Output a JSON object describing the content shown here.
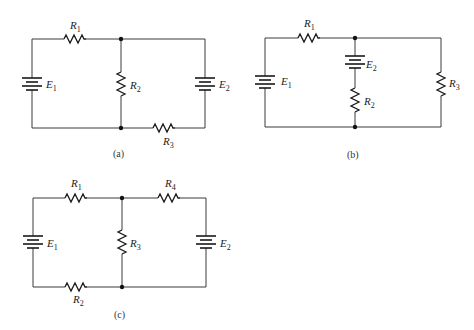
{
  "figure": {
    "circuits": [
      {
        "id": "a",
        "caption": "(a)",
        "components": {
          "R1": {
            "letter": "R",
            "sub": "1"
          },
          "R2": {
            "letter": "R",
            "sub": "2"
          },
          "R3": {
            "letter": "R",
            "sub": "3"
          },
          "E1": {
            "letter": "E",
            "sub": "1"
          },
          "E2": {
            "letter": "E",
            "sub": "2"
          }
        }
      },
      {
        "id": "b",
        "caption": "(b)",
        "components": {
          "R1": {
            "letter": "R",
            "sub": "1"
          },
          "R2": {
            "letter": "R",
            "sub": "2"
          },
          "R3": {
            "letter": "R",
            "sub": "3"
          },
          "E1": {
            "letter": "E",
            "sub": "1"
          },
          "E2": {
            "letter": "E",
            "sub": "2"
          }
        }
      },
      {
        "id": "c",
        "caption": "(c)",
        "components": {
          "R1": {
            "letter": "R",
            "sub": "1"
          },
          "R2": {
            "letter": "R",
            "sub": "2"
          },
          "R3": {
            "letter": "R",
            "sub": "3"
          },
          "R4": {
            "letter": "R",
            "sub": "4"
          },
          "E1": {
            "letter": "E",
            "sub": "1"
          },
          "E2": {
            "letter": "E",
            "sub": "2"
          }
        }
      }
    ]
  }
}
